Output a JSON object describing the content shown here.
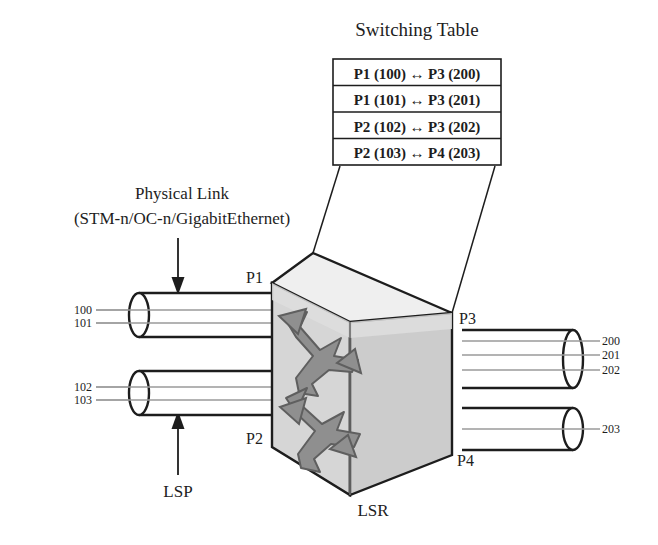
{
  "figure": {
    "kind": "mpls-lsr-switching-diagram",
    "background": "#ffffff",
    "ink": "#1d1d1d"
  },
  "switching_table": {
    "title": "Switching Table",
    "rows": [
      "P1 (100) ↔ P3 (200)",
      "P1 (101) ↔ P3 (201)",
      "P2 (102) ↔ P3 (202)",
      "P2 (103) ↔ P4 (203)"
    ]
  },
  "annotations": {
    "physical_link_line1": "Physical Link",
    "physical_link_line2": "(STM-n/OC-n/GigabitEthernet)",
    "lsp": "LSP",
    "lsr": "LSR"
  },
  "ports": {
    "p1": "P1",
    "p2": "P2",
    "p3": "P3",
    "p4": "P4"
  },
  "labels": {
    "in_upper": [
      "100",
      "101"
    ],
    "in_lower": [
      "102",
      "103"
    ],
    "out_upper": [
      "200",
      "201",
      "202"
    ],
    "out_lower": [
      "203"
    ]
  },
  "colors": {
    "box_front": "#d4d4d4",
    "box_top": "#f2f2f2",
    "box_right": "#bfbfbf",
    "arrow_fill": "#8c8c8c",
    "arrow_stroke": "#5a5a5a",
    "lsp_line": "#a8a8a8",
    "outline": "#1d1d1d"
  }
}
